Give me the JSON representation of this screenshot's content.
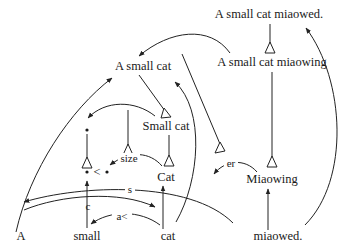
{
  "diagram": {
    "type": "linguistic-derivation-graph",
    "nodes": {
      "top_sentence": "A small cat miaowed.",
      "progressive": "A small cat miaowing",
      "np": "A small cat",
      "nbar": "Small cat",
      "noun_concept": "Cat",
      "verb_concept": "Miaowing",
      "dot_top": "•",
      "dot_compare": "• < •",
      "words": [
        "A",
        "small",
        "cat",
        "miaowed."
      ]
    },
    "edge_labels": {
      "size": "size",
      "s": "s",
      "c": "c",
      "a_lt": "a<",
      "er": "er"
    }
  }
}
